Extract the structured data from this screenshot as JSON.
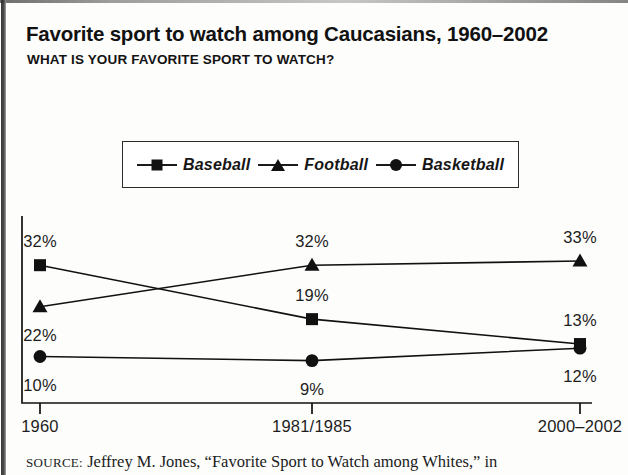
{
  "figure": {
    "title": "Favorite sport to watch among Caucasians, 1960–2002",
    "subtitle": "WHAT IS YOUR FAVORITE SPORT TO WATCH?",
    "source_prefix": "SOURCE:",
    "source_text": " Jeffrey M. Jones, “Favorite Sport to Watch among Whites,” in"
  },
  "legend": {
    "items": [
      {
        "label": "Baseball",
        "marker": "square-marker-icon"
      },
      {
        "label": "Football",
        "marker": "triangle-marker-icon"
      },
      {
        "label": "Basketball",
        "marker": "circle-marker-icon"
      }
    ]
  },
  "chart_data": {
    "type": "line",
    "title": "Favorite sport to watch among Caucasians, 1960–2002",
    "subtitle": "WHAT IS YOUR FAVORITE SPORT TO WATCH?",
    "xlabel": "",
    "ylabel": "",
    "categories": [
      "1960",
      "1981/1985",
      "2000–2002"
    ],
    "ylim": [
      0,
      40
    ],
    "grid": false,
    "legend_position": "top",
    "value_suffix": "%",
    "series": [
      {
        "name": "Baseball",
        "marker": "square",
        "values": [
          32,
          19,
          13
        ],
        "labels": [
          "32%",
          "19%",
          "13%"
        ]
      },
      {
        "name": "Football",
        "marker": "triangle",
        "values": [
          22,
          32,
          33
        ],
        "labels": [
          "22%",
          "32%",
          "33%"
        ]
      },
      {
        "name": "Basketball",
        "marker": "circle",
        "values": [
          10,
          9,
          12
        ],
        "labels": [
          "10%",
          "9%",
          "12%"
        ]
      }
    ]
  },
  "axis": {
    "ticks": [
      "1960",
      "1981/1985",
      "2000–2002"
    ]
  },
  "colors": {
    "ink": "#111111",
    "background": "#ffffff"
  }
}
